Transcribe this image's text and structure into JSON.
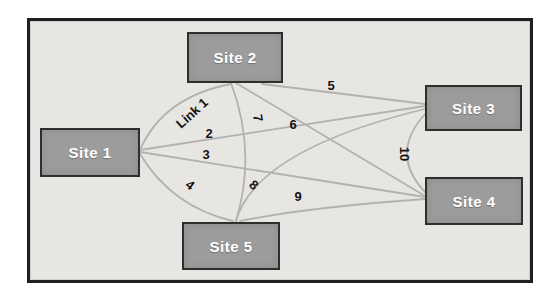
{
  "figure": {
    "page_background": "#ffffff"
  },
  "frame": {
    "x": 27,
    "y": 18,
    "width": 506,
    "height": 265,
    "background": "#e7e6e3",
    "border_color": "#1f1f1f"
  },
  "colors": {
    "site_fill": "#9c9c9c",
    "site_border": "#2e2e2e",
    "site_text": "#ffffff",
    "link_line": "#b3b2ae",
    "label_text": "#141414"
  },
  "sites": [
    {
      "id": "site-1",
      "label": "Site 1",
      "x": 40,
      "y": 128,
      "w": 100,
      "h": 49
    },
    {
      "id": "site-2",
      "label": "Site 2",
      "x": 187,
      "y": 32,
      "w": 96,
      "h": 51
    },
    {
      "id": "site-3",
      "label": "Site 3",
      "x": 425,
      "y": 85,
      "w": 97,
      "h": 46
    },
    {
      "id": "site-4",
      "label": "Site 4",
      "x": 425,
      "y": 177,
      "w": 98,
      "h": 48
    },
    {
      "id": "site-5",
      "label": "Site 5",
      "x": 182,
      "y": 222,
      "w": 98,
      "h": 48
    }
  ],
  "links": [
    {
      "id": "link-1",
      "label": "Link 1",
      "from": "Site 1",
      "to": "Site 2",
      "path": "M 140 150 Q 163 97 231 84",
      "label_x": 192,
      "label_y": 113,
      "label_rotation": -42
    },
    {
      "id": "link-2",
      "label": "2",
      "from": "Site 1",
      "to": "Site 3",
      "path": "M 140 150 L 425 106",
      "label_x": 209,
      "label_y": 133,
      "label_rotation": 0
    },
    {
      "id": "link-3",
      "label": "3",
      "from": "Site 1",
      "to": "Site 4",
      "path": "M 140 152 L 425 197",
      "label_x": 206,
      "label_y": 154,
      "label_rotation": 0
    },
    {
      "id": "link-4",
      "label": "4",
      "from": "Site 1",
      "to": "Site 5",
      "path": "M 140 154 Q 172 207 233 221",
      "label_x": 190,
      "label_y": 185,
      "label_rotation": 38
    },
    {
      "id": "link-5",
      "label": "5",
      "from": "Site 2",
      "to": "Site 3",
      "path": "M 262 84 L 425 104",
      "label_x": 331,
      "label_y": 85,
      "label_rotation": 0
    },
    {
      "id": "link-6",
      "label": "6",
      "from": "Site 2",
      "to": "Site 4",
      "path": "M 236 83 L 425 196",
      "label_x": 293,
      "label_y": 124,
      "label_rotation": 0
    },
    {
      "id": "link-7",
      "label": "7",
      "from": "Site 2",
      "to": "Site 5",
      "path": "M 231 83 Q 257 152 236 221",
      "label_x": 258,
      "label_y": 118,
      "label_rotation": 80
    },
    {
      "id": "link-8",
      "label": "8",
      "from": "Site 5",
      "to": "Site 3",
      "path": "M 236 221 Q 256 150 425 109",
      "label_x": 254,
      "label_y": 185,
      "label_rotation": 40
    },
    {
      "id": "link-9",
      "label": "9",
      "from": "Site 5",
      "to": "Site 4",
      "path": "M 240 221 Q 310 207 425 199",
      "label_x": 298,
      "label_y": 196,
      "label_rotation": 0
    },
    {
      "id": "link-10",
      "label": "10",
      "from": "Site 3",
      "to": "Site 4",
      "path": "M 426 113 Q 388 154 426 193",
      "label_x": 404,
      "label_y": 154,
      "label_rotation": 90
    }
  ]
}
